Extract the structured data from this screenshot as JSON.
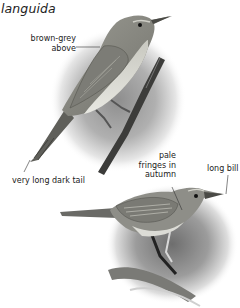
{
  "page": {
    "title": "languida"
  },
  "illustrations": [
    {
      "name": "perched-adult",
      "labels": [
        {
          "text_lines": [
            "brown-grey",
            "above"
          ]
        },
        {
          "text": "very long dark tail"
        }
      ]
    },
    {
      "name": "autumn-bird",
      "labels": [
        {
          "text_lines": [
            "pale",
            "fringes in",
            "autumn"
          ]
        },
        {
          "text": "long bill"
        }
      ]
    }
  ],
  "colors": {
    "ink": "#222222",
    "bird_body": "#8a8a84",
    "vignette": "#9a9a9a"
  }
}
